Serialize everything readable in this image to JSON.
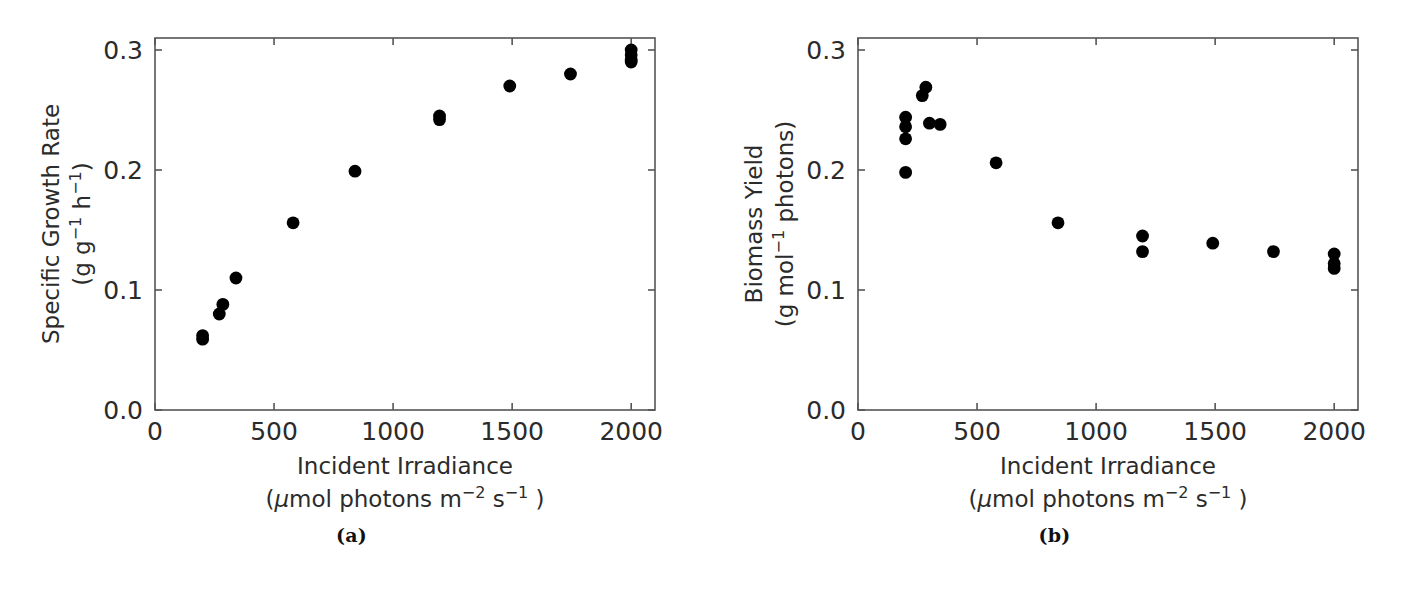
{
  "figure": {
    "background_color": "#ffffff",
    "marker_color": "#000000",
    "axis_color": "#555555"
  },
  "panels": [
    {
      "id": "a",
      "caption": "(a)",
      "xlabel_line1": "Incident Irradiance",
      "xlabel_line2_pre": "(",
      "xlabel_line2_mu": "μ",
      "xlabel_line2_mid": "mol photons m",
      "xlabel_line2_sup1": "−2",
      "xlabel_line2_mid2": " s",
      "xlabel_line2_sup2": "−1",
      "xlabel_line2_post": " )",
      "ylabel_line1": "Specific Growth Rate",
      "ylabel_line2_pre": "(g g",
      "ylabel_line2_sup1": "−1",
      "ylabel_line2_mid": " h",
      "ylabel_line2_sup2": "−1",
      "ylabel_line2_post": ")",
      "xticks": [
        "0",
        "500",
        "1000",
        "1500",
        "2000"
      ],
      "yticks": [
        "0.0",
        "0.1",
        "0.2",
        "0.3"
      ]
    },
    {
      "id": "b",
      "caption": "(b)",
      "xlabel_line1": "Incident Irradiance",
      "xlabel_line2_pre": "(",
      "xlabel_line2_mu": "μ",
      "xlabel_line2_mid": "mol photons m",
      "xlabel_line2_sup1": "−2",
      "xlabel_line2_mid2": " s",
      "xlabel_line2_sup2": "−1",
      "xlabel_line2_post": " )",
      "ylabel_line1": "Biomass Yield",
      "ylabel_line2_pre": "(g mol",
      "ylabel_line2_sup1": "−1",
      "ylabel_line2_mid": " photons)",
      "ylabel_line2_sup2": "",
      "ylabel_line2_post": "",
      "xticks": [
        "0",
        "500",
        "1000",
        "1500",
        "2000"
      ],
      "yticks": [
        "0.0",
        "0.1",
        "0.2",
        "0.3"
      ]
    }
  ],
  "chart_data": [
    {
      "type": "scatter",
      "panel": "a",
      "title": "",
      "xlabel": "Incident Irradiance (μmol photons m−2 s−1 )",
      "ylabel": "Specific Growth Rate (g g−1 h−1)",
      "xlim": [
        0,
        2100
      ],
      "ylim": [
        0.0,
        0.31
      ],
      "xticks": [
        0,
        500,
        1000,
        1500,
        2000
      ],
      "yticks": [
        0.0,
        0.1,
        0.2,
        0.3
      ],
      "grid": false,
      "legend": null,
      "marker": "circle",
      "marker_color": "#000000",
      "points": [
        {
          "x": 200,
          "y": 0.062
        },
        {
          "x": 200,
          "y": 0.059
        },
        {
          "x": 270,
          "y": 0.08
        },
        {
          "x": 285,
          "y": 0.088
        },
        {
          "x": 340,
          "y": 0.11
        },
        {
          "x": 580,
          "y": 0.156
        },
        {
          "x": 840,
          "y": 0.199
        },
        {
          "x": 1195,
          "y": 0.245
        },
        {
          "x": 1195,
          "y": 0.242
        },
        {
          "x": 1490,
          "y": 0.27
        },
        {
          "x": 1745,
          "y": 0.28
        },
        {
          "x": 2000,
          "y": 0.3
        },
        {
          "x": 2000,
          "y": 0.296
        },
        {
          "x": 2000,
          "y": 0.292
        },
        {
          "x": 2000,
          "y": 0.29
        }
      ]
    },
    {
      "type": "scatter",
      "panel": "b",
      "title": "",
      "xlabel": "Incident Irradiance (μmol photons m−2 s−1 )",
      "ylabel": "Biomass Yield (g mol−1 photons)",
      "xlim": [
        0,
        2100
      ],
      "ylim": [
        0.0,
        0.31
      ],
      "xticks": [
        0,
        500,
        1000,
        1500,
        2000
      ],
      "yticks": [
        0.0,
        0.1,
        0.2,
        0.3
      ],
      "grid": false,
      "legend": null,
      "marker": "circle",
      "marker_color": "#000000",
      "points": [
        {
          "x": 200,
          "y": 0.244
        },
        {
          "x": 200,
          "y": 0.236
        },
        {
          "x": 200,
          "y": 0.226
        },
        {
          "x": 200,
          "y": 0.198
        },
        {
          "x": 270,
          "y": 0.262
        },
        {
          "x": 285,
          "y": 0.269
        },
        {
          "x": 300,
          "y": 0.239
        },
        {
          "x": 345,
          "y": 0.238
        },
        {
          "x": 580,
          "y": 0.206
        },
        {
          "x": 840,
          "y": 0.156
        },
        {
          "x": 1195,
          "y": 0.145
        },
        {
          "x": 1195,
          "y": 0.132
        },
        {
          "x": 1490,
          "y": 0.139
        },
        {
          "x": 1745,
          "y": 0.132
        },
        {
          "x": 2000,
          "y": 0.13
        },
        {
          "x": 2000,
          "y": 0.122
        },
        {
          "x": 2000,
          "y": 0.118
        }
      ]
    }
  ]
}
